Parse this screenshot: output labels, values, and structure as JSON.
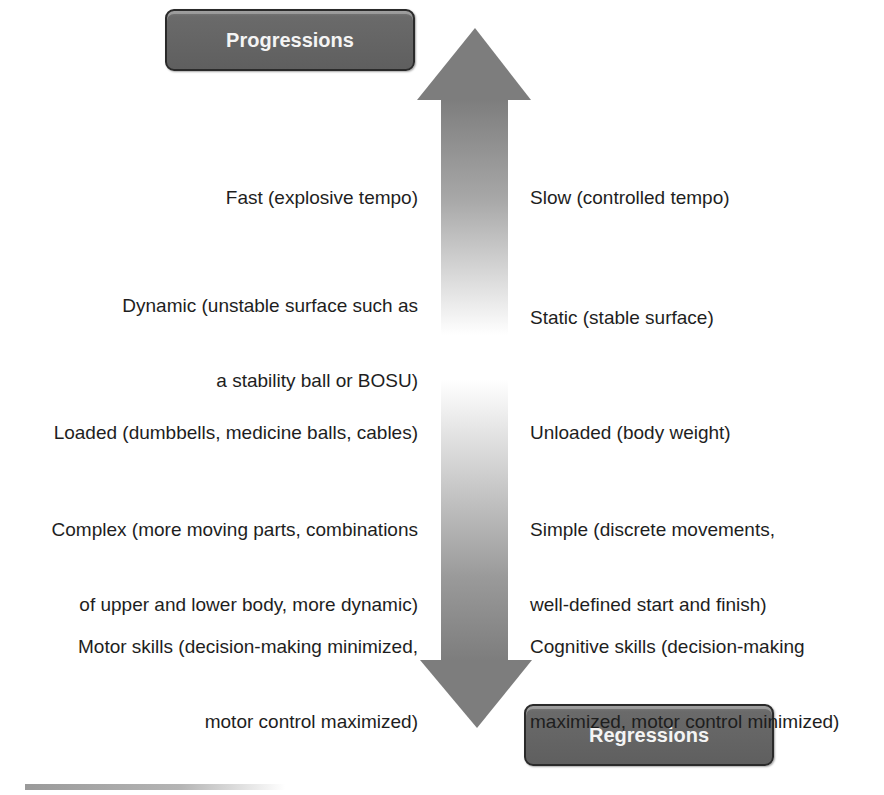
{
  "diagram": {
    "top_label": "Progressions",
    "bottom_label": "Regressions",
    "arrow": {
      "direction": "bidirectional-vertical",
      "color_end": "#7a7a7a",
      "color_mid": "#ffffff"
    },
    "rows": [
      {
        "progression": [
          "Fast (explosive tempo)"
        ],
        "regression": [
          "Slow (controlled tempo)"
        ]
      },
      {
        "progression": [
          "Dynamic (unstable surface such as",
          "a stability ball or BOSU)"
        ],
        "regression": [
          "Static (stable surface)"
        ]
      },
      {
        "progression": [
          "Loaded (dumbbells, medicine balls, cables)"
        ],
        "regression": [
          "Unloaded (body weight)"
        ]
      },
      {
        "progression": [
          "Complex (more moving parts, combinations",
          "of upper and lower body, more dynamic)"
        ],
        "regression": [
          "Simple (discrete movements,",
          "well-defined start and finish)"
        ]
      },
      {
        "progression": [
          "Motor skills (decision-making minimized,",
          "motor control maximized)"
        ],
        "regression": [
          "Cognitive skills (decision-making",
          "maximized, motor control minimized)"
        ]
      }
    ]
  }
}
